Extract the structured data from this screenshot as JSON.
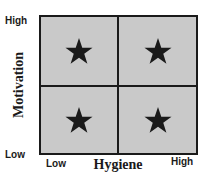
{
  "diagram": {
    "type": "2x2 matrix",
    "y_axis": {
      "title": "Motivation",
      "high_label": "High",
      "low_label": "Low"
    },
    "x_axis": {
      "title": "Hygiene",
      "low_label": "Low",
      "high_label": "High"
    },
    "quadrants": [
      {
        "position": "top-left",
        "marker": "star-icon",
        "motivation": "High",
        "hygiene": "Low"
      },
      {
        "position": "top-right",
        "marker": "star-icon",
        "motivation": "High",
        "hygiene": "High"
      },
      {
        "position": "bottom-left",
        "marker": "star-icon",
        "motivation": "Low",
        "hygiene": "Low"
      },
      {
        "position": "bottom-right",
        "marker": "star-icon",
        "motivation": "Low",
        "hygiene": "High"
      }
    ],
    "colors": {
      "fill": "#c9c9c9",
      "lines": "#1a1a1a",
      "star": "#1a1a1a"
    }
  }
}
